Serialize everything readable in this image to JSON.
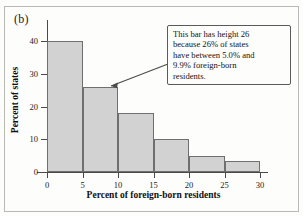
{
  "figure": {
    "panel_label": "(b)"
  },
  "chart_data": {
    "type": "bar",
    "title": "",
    "xlabel": "Percent of foreign-born residents",
    "ylabel": "Percent of states",
    "categories": [
      "0-5",
      "5-10",
      "10-15",
      "15-20",
      "20-25",
      "25-30"
    ],
    "bin_edges": [
      0,
      5,
      10,
      15,
      20,
      25,
      30
    ],
    "values": [
      40,
      26,
      18,
      10,
      5,
      3.5
    ],
    "xlim": [
      0,
      30
    ],
    "ylim": [
      0,
      44
    ],
    "xticks": [
      0,
      5,
      10,
      15,
      20,
      25,
      30
    ],
    "xtick_labels": [
      "0",
      "5",
      "10",
      "15",
      "20",
      "25",
      "30"
    ],
    "yticks": [
      0,
      10,
      20,
      30,
      40
    ],
    "ytick_labels": [
      "0",
      "10",
      "20",
      "30",
      "40"
    ],
    "grid": false,
    "legend": false,
    "bar_fill_color": "#d2d2d2",
    "bar_edge_color": "#6f6f6f",
    "annotations": [
      {
        "text": "This bar has height 26 because 26% of states have between 5.0% and 9.9% foreign-born residents.",
        "points_to_bin": "5-10"
      }
    ]
  },
  "callout": {
    "line1": "This bar has height 26",
    "line2": "because 26% of states",
    "line3": "have between 5.0% and",
    "line4": "9.9% foreign-born",
    "line5": "residents."
  }
}
